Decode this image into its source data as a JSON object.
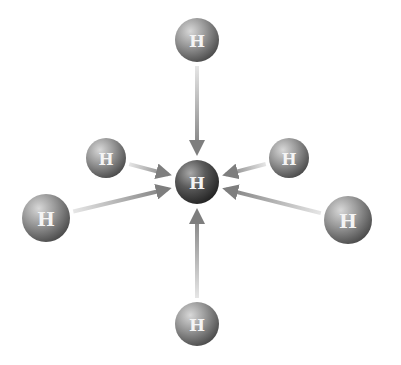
{
  "diagram": {
    "center_atom": {
      "label": "H",
      "x": 197,
      "y": 182,
      "r": 22
    },
    "outer_atoms": [
      {
        "id": "top",
        "label": "H",
        "x": 197,
        "y": 40,
        "r": 22
      },
      {
        "id": "upper-left",
        "label": "H",
        "x": 106,
        "y": 158,
        "r": 20
      },
      {
        "id": "upper-right",
        "label": "H",
        "x": 289,
        "y": 158,
        "r": 20
      },
      {
        "id": "left",
        "label": "H",
        "x": 46,
        "y": 218,
        "r": 24
      },
      {
        "id": "right",
        "label": "H",
        "x": 348,
        "y": 220,
        "r": 24
      },
      {
        "id": "bottom",
        "label": "H",
        "x": 197,
        "y": 324,
        "r": 22
      }
    ],
    "colors": {
      "atom_light": "#b8b8b8",
      "atom_dark": "#555555",
      "center_dark": "#333333",
      "arrow": "#8a8a8a"
    }
  }
}
